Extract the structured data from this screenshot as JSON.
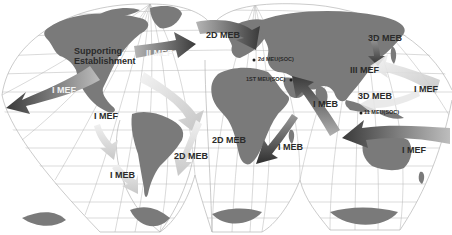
{
  "map": {
    "type": "world-map-interrupted-projection",
    "colors": {
      "background": "#ffffff",
      "land": "#7a7a7a",
      "graticule": "#a8a8a8",
      "arrow_dark": "#3c3c3c",
      "arrow_light": "#d8d8d8",
      "label_text": "#2a2a2a"
    },
    "labels": {
      "supporting_establishment_1": "Supporting",
      "supporting_establishment_2": "Establishment",
      "ii_mef": "II MEF",
      "i_mef_west": "I MEF",
      "i_mef_south_atlantic": "I MEF",
      "i_meb_south_america": "I MEB",
      "2d_meb_north": "2D MEB",
      "2d_meb_south_1": "2D MEB",
      "2d_meb_south_2": "2D MEB",
      "2d_meu_soc": "2d MEU(SOC)",
      "1st_meu_soc": "1ST MEU(SOC)",
      "3d_meb_north": "3D MEB",
      "iii_mef": "III MEF",
      "3d_meb_south": "3D MEB",
      "11_meu_soc": "11 MEU(SOC)",
      "i_mef_pacific_north": "I MEF",
      "i_meb_indian": "I MEB",
      "i_meb_africa": "I MEB",
      "i_mef_pacific_south": "I MEF"
    }
  }
}
